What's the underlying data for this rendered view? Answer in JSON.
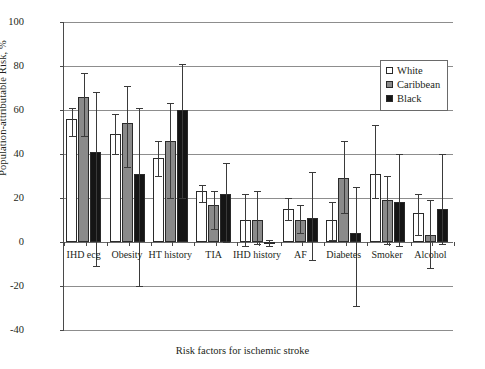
{
  "chart_data": {
    "type": "bar",
    "title": "",
    "xlabel": "Risk factors for ischemic stroke",
    "ylabel": "Population-attributable Risk, %",
    "ylim": [
      -40,
      100
    ],
    "yticks": [
      100,
      80,
      60,
      40,
      20,
      0,
      -20,
      -40
    ],
    "grid": true,
    "legend_position": "top-right",
    "categories": [
      "IHD ecg",
      "Obesity",
      "HT history",
      "TIA",
      "IHD history",
      "AF",
      "Diabetes",
      "Smoker",
      "Alcohol"
    ],
    "series": [
      {
        "name": "White",
        "color": "#ffffff",
        "values": [
          56,
          49,
          38,
          23,
          10,
          15,
          10,
          31,
          13
        ],
        "err_low": [
          48,
          40,
          30,
          18,
          -2,
          10,
          1,
          20,
          3
        ],
        "err_high": [
          61,
          58,
          46,
          26,
          22,
          20,
          18,
          53,
          22
        ]
      },
      {
        "name": "Caribbean",
        "color": "#8a8a8a",
        "values": [
          66,
          54,
          46,
          17,
          10,
          10,
          29,
          19,
          3
        ],
        "err_low": [
          48,
          34,
          20,
          6,
          -1,
          4,
          13,
          -1,
          -12
        ],
        "err_high": [
          77,
          71,
          63,
          23,
          23,
          17,
          46,
          30,
          19
        ]
      },
      {
        "name": "Black",
        "color": "#151515",
        "values": [
          41,
          31,
          60,
          22,
          -1,
          11,
          4,
          18,
          15
        ],
        "err_low": [
          -11,
          -20,
          20,
          0,
          -2,
          -8,
          -29,
          -2,
          -1
        ],
        "err_high": [
          68,
          61,
          81,
          36,
          1,
          32,
          25,
          40,
          40
        ]
      }
    ]
  },
  "legend": {
    "entries": [
      {
        "label": "White"
      },
      {
        "label": "Caribbean"
      },
      {
        "label": "Black"
      }
    ]
  }
}
